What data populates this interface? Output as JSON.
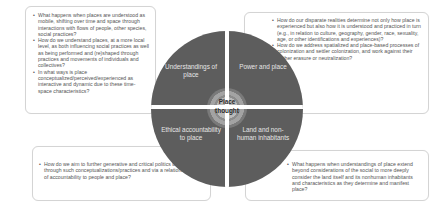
{
  "diagram": {
    "center": {
      "label_line1": "Place",
      "label_line2": "thought"
    },
    "quadrants": [
      {
        "position": "top-left",
        "label": "Understandings of place"
      },
      {
        "position": "top-right",
        "label": "Power and place"
      },
      {
        "position": "bottom-left",
        "label": "Ethical accountability to place"
      },
      {
        "position": "bottom-right",
        "label": "Land and non-human inhabitants"
      }
    ],
    "colors": {
      "quadrant_fill": "#5d5d5d",
      "divider": "#ffffff",
      "text_on_dark": "#e6e6e6",
      "box_text": "#555555",
      "box_border": "#d4d4d4"
    }
  },
  "boxes": {
    "top_left": {
      "bullets": [
        "What happens when places are understood as mobile, shifting over time and space through interactions with flows of people, other species, social practices?",
        "How do we understand places, at a more local level, as both influencing social practices as well as being performed and (re)shaped through practices and movements of individuals and collectives?",
        "In what ways is place conceptualized/perceived/experienced as interactive and dynamic due to these time-space characteristics?"
      ]
    },
    "top_right": {
      "bullets": [
        "How do our disparate realities determine not only how place is experienced but also how it is understood and practiced in turn (e.g., in relation to culture, geography, gender, race, sexuality, age, or other identifications and experiences)?",
        "How do we address spatialized and place-based processes  of colonization and settler colonization, and work against their further erasure or neutralization?"
      ]
    },
    "bottom_left": {
      "bullets": [
        "How do we aim to further generative and critical politics of places through such conceptualizations/practices and via a relational ethics of accountability to people and place?"
      ]
    },
    "bottom_right": {
      "bullets": [
        "What happens when understandings of place extend beyond considerations of the social to more deeply consider the land itself and its nonhuman inhabitants and characteristics as they determine and manifest place?"
      ]
    }
  }
}
